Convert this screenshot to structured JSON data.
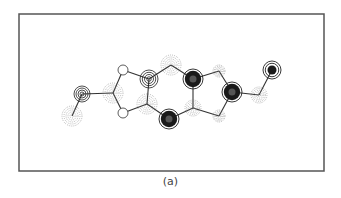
{
  "figure": {
    "caption": "(a)",
    "frame": {
      "x": 19,
      "y": 14,
      "width": 305,
      "height": 157
    },
    "colors": {
      "frame": "#555555",
      "bond": "#333333",
      "solid": "#222222",
      "dashed": "#777777",
      "filled": "#1a1a1a"
    },
    "atoms": [
      {
        "id": 0,
        "x": 72,
        "y": 116,
        "style": "dashed",
        "r": 10
      },
      {
        "id": 1,
        "x": 82,
        "y": 94,
        "style": "solid",
        "r": 8
      },
      {
        "id": 2,
        "x": 113,
        "y": 93,
        "style": "dashed",
        "r": 10
      },
      {
        "id": 3,
        "x": 123,
        "y": 70,
        "style": "open",
        "r": 5
      },
      {
        "id": 4,
        "x": 123,
        "y": 113,
        "style": "open",
        "r": 5
      },
      {
        "id": 5,
        "x": 149,
        "y": 79,
        "style": "solid",
        "r": 9
      },
      {
        "id": 6,
        "x": 147,
        "y": 104,
        "style": "dashed",
        "r": 10
      },
      {
        "id": 7,
        "x": 171,
        "y": 65,
        "style": "dashed",
        "r": 10
      },
      {
        "id": 8,
        "x": 169,
        "y": 119,
        "style": "filled",
        "r": 10
      },
      {
        "id": 9,
        "x": 193,
        "y": 79,
        "style": "filled",
        "r": 10
      },
      {
        "id": 10,
        "x": 193,
        "y": 108,
        "style": "dashed",
        "r": 8
      },
      {
        "id": 11,
        "x": 219,
        "y": 71,
        "style": "dashed",
        "r": 6
      },
      {
        "id": 12,
        "x": 219,
        "y": 116,
        "style": "dashed",
        "r": 6
      },
      {
        "id": 13,
        "x": 232,
        "y": 92,
        "style": "filled",
        "r": 10
      },
      {
        "id": 14,
        "x": 259,
        "y": 95,
        "style": "dashed",
        "r": 8
      },
      {
        "id": 15,
        "x": 272,
        "y": 70,
        "style": "filled-rings",
        "r": 9
      }
    ],
    "bonds": [
      [
        0,
        1
      ],
      [
        1,
        2
      ],
      [
        2,
        3
      ],
      [
        2,
        4
      ],
      [
        3,
        5
      ],
      [
        4,
        6
      ],
      [
        5,
        6
      ],
      [
        5,
        7
      ],
      [
        6,
        8
      ],
      [
        7,
        9
      ],
      [
        8,
        10
      ],
      [
        9,
        10
      ],
      [
        9,
        11
      ],
      [
        10,
        12
      ],
      [
        11,
        13
      ],
      [
        12,
        13
      ],
      [
        13,
        14
      ],
      [
        14,
        15
      ]
    ]
  }
}
